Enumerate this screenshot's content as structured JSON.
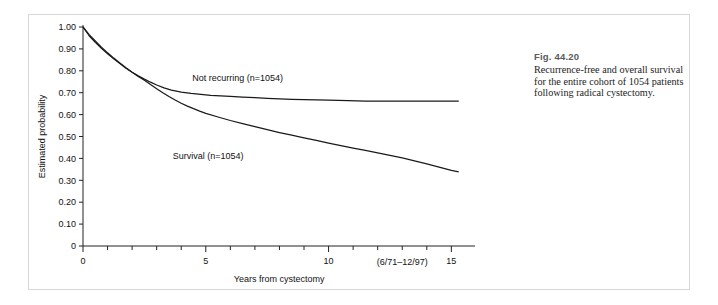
{
  "figure": {
    "number_label": "Fig. 44.20",
    "caption": "Recurrence-free and overall survival for the entire cohort of 1054 patients following radical cystectomy."
  },
  "chart_data": {
    "type": "line",
    "title": "",
    "xlabel": "Years from cystectomy",
    "ylabel": "Estimated probability",
    "xlim": [
      0,
      15.8
    ],
    "ylim": [
      0,
      1.0
    ],
    "grid": false,
    "legend_position": "inline-annotations",
    "x_major_ticks": [
      0,
      5,
      10,
      15
    ],
    "x_major_tick_labels": [
      "0",
      "5",
      "10",
      "15"
    ],
    "x_minor_tick_interval": 1,
    "y_ticks": [
      0,
      0.1,
      0.2,
      0.3,
      0.4,
      0.5,
      0.6,
      0.7,
      0.8,
      0.9,
      1.0
    ],
    "y_tick_labels": [
      "0",
      "0.10",
      "0.20",
      "0.30",
      "0.40",
      "0.50",
      "0.60",
      "0.70",
      "0.80",
      "0.90",
      "1.00"
    ],
    "annotations": [
      {
        "name": "date-range",
        "text": "(6/71–12/97)",
        "x": 13.0,
        "y": -0.085
      }
    ],
    "series": [
      {
        "name": "Not recurring (n=1054)",
        "label": "Not recurring (n=1054)",
        "label_x": 6.3,
        "label_y": 0.755,
        "color": "#1a1a1a",
        "points": [
          [
            0.0,
            1.0
          ],
          [
            0.25,
            0.96
          ],
          [
            0.5,
            0.93
          ],
          [
            0.75,
            0.903
          ],
          [
            1.0,
            0.878
          ],
          [
            1.25,
            0.855
          ],
          [
            1.5,
            0.833
          ],
          [
            1.75,
            0.812
          ],
          [
            2.0,
            0.793
          ],
          [
            2.25,
            0.777
          ],
          [
            2.5,
            0.762
          ],
          [
            2.75,
            0.748
          ],
          [
            3.0,
            0.735
          ],
          [
            3.3,
            0.722
          ],
          [
            3.6,
            0.712
          ],
          [
            4.0,
            0.703
          ],
          [
            4.4,
            0.697
          ],
          [
            4.8,
            0.692
          ],
          [
            5.2,
            0.688
          ],
          [
            5.6,
            0.685
          ],
          [
            6.0,
            0.683
          ],
          [
            6.5,
            0.68
          ],
          [
            7.0,
            0.677
          ],
          [
            7.5,
            0.674
          ],
          [
            8.0,
            0.672
          ],
          [
            8.5,
            0.67
          ],
          [
            9.0,
            0.668
          ],
          [
            9.5,
            0.667
          ],
          [
            10.0,
            0.666
          ],
          [
            10.8,
            0.664
          ],
          [
            11.5,
            0.662
          ],
          [
            12.5,
            0.661
          ],
          [
            13.5,
            0.661
          ],
          [
            14.5,
            0.661
          ],
          [
            15.3,
            0.661
          ]
        ]
      },
      {
        "name": "Survival (n=1054)",
        "label": "Survival (n=1054)",
        "label_x": 5.1,
        "label_y": 0.395,
        "color": "#1a1a1a",
        "points": [
          [
            0.0,
            1.0
          ],
          [
            0.25,
            0.965
          ],
          [
            0.5,
            0.936
          ],
          [
            0.75,
            0.908
          ],
          [
            1.0,
            0.882
          ],
          [
            1.25,
            0.858
          ],
          [
            1.5,
            0.836
          ],
          [
            1.75,
            0.814
          ],
          [
            2.0,
            0.793
          ],
          [
            2.25,
            0.774
          ],
          [
            2.5,
            0.757
          ],
          [
            2.75,
            0.737
          ],
          [
            3.0,
            0.718
          ],
          [
            3.25,
            0.7
          ],
          [
            3.5,
            0.683
          ],
          [
            3.75,
            0.667
          ],
          [
            4.0,
            0.652
          ],
          [
            4.25,
            0.639
          ],
          [
            4.5,
            0.627
          ],
          [
            4.75,
            0.616
          ],
          [
            5.0,
            0.606
          ],
          [
            5.5,
            0.589
          ],
          [
            6.0,
            0.573
          ],
          [
            6.5,
            0.559
          ],
          [
            7.0,
            0.545
          ],
          [
            7.5,
            0.531
          ],
          [
            8.0,
            0.518
          ],
          [
            8.5,
            0.506
          ],
          [
            9.0,
            0.494
          ],
          [
            9.5,
            0.482
          ],
          [
            10.0,
            0.47
          ],
          [
            10.5,
            0.458
          ],
          [
            11.0,
            0.447
          ],
          [
            11.5,
            0.437
          ],
          [
            12.0,
            0.425
          ],
          [
            12.5,
            0.414
          ],
          [
            13.0,
            0.402
          ],
          [
            13.5,
            0.389
          ],
          [
            14.0,
            0.375
          ],
          [
            14.5,
            0.36
          ],
          [
            15.0,
            0.345
          ],
          [
            15.3,
            0.338
          ]
        ]
      }
    ]
  }
}
